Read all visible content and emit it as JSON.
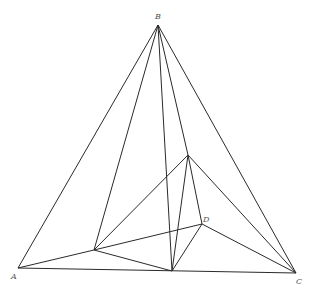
{
  "diagram": {
    "type": "geometry",
    "stroke_color": "#2a2a2a",
    "points": {
      "A": {
        "x": 18,
        "y": 268,
        "label": "A",
        "lx": 11,
        "ly": 279
      },
      "B": {
        "x": 158,
        "y": 25,
        "label": "B",
        "lx": 155,
        "ly": 19
      },
      "C": {
        "x": 296,
        "y": 273,
        "label": "C",
        "lx": 296,
        "ly": 284
      },
      "D": {
        "x": 202,
        "y": 224,
        "label": "D",
        "lx": 203,
        "ly": 222
      },
      "E": {
        "x": 188,
        "y": 155,
        "label": ""
      },
      "P": {
        "x": 94,
        "y": 250,
        "label": ""
      },
      "Q": {
        "x": 172,
        "y": 271,
        "label": ""
      }
    },
    "edges": [
      [
        "A",
        "B"
      ],
      [
        "B",
        "C"
      ],
      [
        "A",
        "C"
      ],
      [
        "A",
        "P"
      ],
      [
        "P",
        "B"
      ],
      [
        "B",
        "Q"
      ],
      [
        "B",
        "E"
      ],
      [
        "E",
        "D"
      ],
      [
        "P",
        "E"
      ],
      [
        "P",
        "D"
      ],
      [
        "P",
        "Q"
      ],
      [
        "E",
        "C"
      ],
      [
        "E",
        "Q"
      ],
      [
        "D",
        "C"
      ],
      [
        "D",
        "Q"
      ]
    ],
    "labels": {
      "A": "A",
      "B": "B",
      "C": "C",
      "D": "D"
    }
  }
}
